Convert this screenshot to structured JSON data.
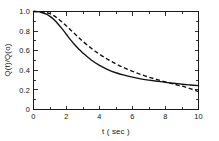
{
  "chart_data": {
    "type": "line",
    "title": "",
    "xlabel": "t ( sec )",
    "ylabel": "Q(t)/Q(o)",
    "xlim": [
      0,
      10
    ],
    "ylim": [
      0,
      1.0
    ],
    "grid": false,
    "legend": "none",
    "xticks": [
      0,
      2,
      4,
      6,
      8,
      10
    ],
    "xtick_labels": [
      "0",
      "2",
      "4",
      "6",
      "8",
      "10"
    ],
    "xminor_ticks": [
      1,
      3,
      5,
      7,
      9
    ],
    "yticks": [
      0,
      0.2,
      0.4,
      0.6,
      0.8,
      1.0
    ],
    "ytick_labels": [
      "0",
      "0.2",
      "0.4",
      "0.6",
      "0.8",
      "1.0"
    ],
    "yminor_ticks": [
      0.1,
      0.3,
      0.5,
      0.7,
      0.9
    ],
    "ticks_direction": "inward",
    "frame": "box",
    "series": [
      {
        "name": "solid-curve",
        "style": "solid",
        "color": "#111111",
        "x": [
          0,
          0.25,
          0.5,
          0.75,
          1.0,
          1.25,
          1.5,
          1.75,
          2.0,
          2.25,
          2.5,
          2.75,
          3.0,
          3.5,
          4.0,
          4.5,
          5.0,
          5.5,
          6.0,
          6.5,
          7.0,
          7.5,
          8.0,
          8.5,
          9.0,
          9.5,
          10.0
        ],
        "y": [
          1.0,
          0.998,
          0.99,
          0.975,
          0.95,
          0.915,
          0.87,
          0.82,
          0.765,
          0.71,
          0.66,
          0.615,
          0.575,
          0.505,
          0.45,
          0.408,
          0.375,
          0.35,
          0.33,
          0.313,
          0.3,
          0.288,
          0.277,
          0.268,
          0.258,
          0.25,
          0.243
        ]
      },
      {
        "name": "dashed-curve",
        "style": "dashed",
        "color": "#111111",
        "x": [
          0,
          0.25,
          0.5,
          0.75,
          1.0,
          1.25,
          1.5,
          1.75,
          2.0,
          2.25,
          2.5,
          2.75,
          3.0,
          3.5,
          4.0,
          4.5,
          5.0,
          5.5,
          6.0,
          6.5,
          7.0,
          7.5,
          8.0,
          8.5,
          9.0,
          9.5,
          10.0
        ],
        "y": [
          1.0,
          0.999,
          0.996,
          0.99,
          0.978,
          0.955,
          0.925,
          0.89,
          0.852,
          0.812,
          0.772,
          0.732,
          0.694,
          0.625,
          0.565,
          0.512,
          0.465,
          0.425,
          0.39,
          0.358,
          0.33,
          0.305,
          0.282,
          0.26,
          0.238,
          0.212,
          0.183
        ]
      }
    ]
  }
}
